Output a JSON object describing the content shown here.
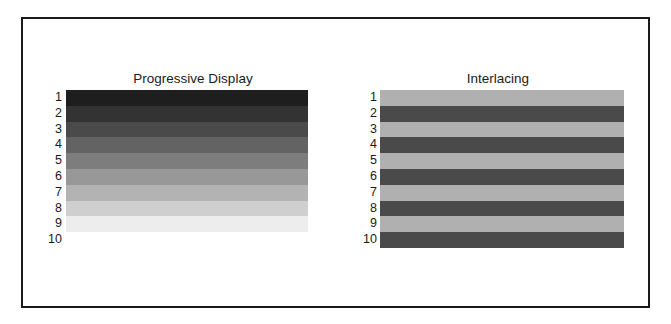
{
  "panels": [
    {
      "title": "Progressive Display",
      "rows": [
        "1",
        "2",
        "3",
        "4",
        "5",
        "6",
        "7",
        "8",
        "9",
        "10"
      ],
      "stripe_colors": [
        "#1e1e1e",
        "#333333",
        "#4a4a4a",
        "#636363",
        "#7d7d7d",
        "#989898",
        "#b3b3b3",
        "#cfcfcf",
        "#ededed"
      ]
    },
    {
      "title": "Interlacing",
      "rows": [
        "1",
        "2",
        "3",
        "4",
        "5",
        "6",
        "7",
        "8",
        "9",
        "10"
      ],
      "stripe_colors": [
        "#b0b0b0",
        "#4a4a4a",
        "#b0b0b0",
        "#4a4a4a",
        "#b0b0b0",
        "#4a4a4a",
        "#b0b0b0",
        "#4a4a4a",
        "#b0b0b0",
        "#4a4a4a"
      ]
    }
  ]
}
